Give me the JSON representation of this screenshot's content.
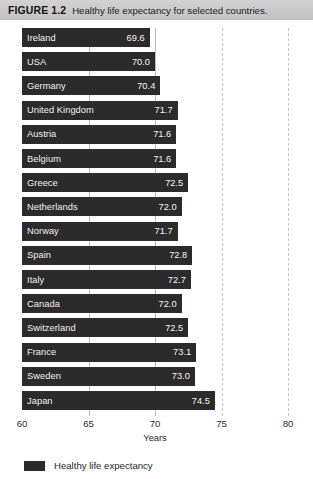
{
  "caption": {
    "label": "FIGURE 1.2",
    "text": "Healthy life expectancy for selected countries."
  },
  "chart_data": {
    "type": "bar",
    "orientation": "horizontal",
    "title": "Healthy life expectancy for selected countries.",
    "xlabel": "Years",
    "ylabel": "",
    "xlim": [
      60,
      80
    ],
    "xticks": [
      60,
      65,
      70,
      75,
      80
    ],
    "grid": true,
    "grid_style": "dashed-vertical",
    "legend": {
      "position": "bottom-left",
      "entries": [
        {
          "name": "Healthy life expectancy",
          "color": "#2b2b2b"
        }
      ]
    },
    "bar_color": "#2b2b2b",
    "value_label_color": "#f5f5f5",
    "categories": [
      "Ireland",
      "USA",
      "Germany",
      "United Kingdom",
      "Austria",
      "Belgium",
      "Greece",
      "Netherlands",
      "Norway",
      "Spain",
      "Italy",
      "Canada",
      "Switzerland",
      "France",
      "Sweden",
      "Japan"
    ],
    "values": [
      69.6,
      70.0,
      70.4,
      71.7,
      71.6,
      71.6,
      72.5,
      72.0,
      71.7,
      72.8,
      72.7,
      72.0,
      72.5,
      73.1,
      73.0,
      74.5
    ],
    "value_labels": [
      "69.6",
      "70.0",
      "70.4",
      "71.7",
      "71.6",
      "71.6",
      "72.5",
      "72.0",
      "71.7",
      "72.8",
      "72.7",
      "72.0",
      "72.5",
      "73.1",
      "73.0",
      "74.5"
    ],
    "series": [
      {
        "name": "Healthy life expectancy",
        "values": [
          69.6,
          70.0,
          70.4,
          71.7,
          71.6,
          71.6,
          72.5,
          72.0,
          71.7,
          72.8,
          72.7,
          72.0,
          72.5,
          73.1,
          73.0,
          74.5
        ]
      }
    ]
  }
}
